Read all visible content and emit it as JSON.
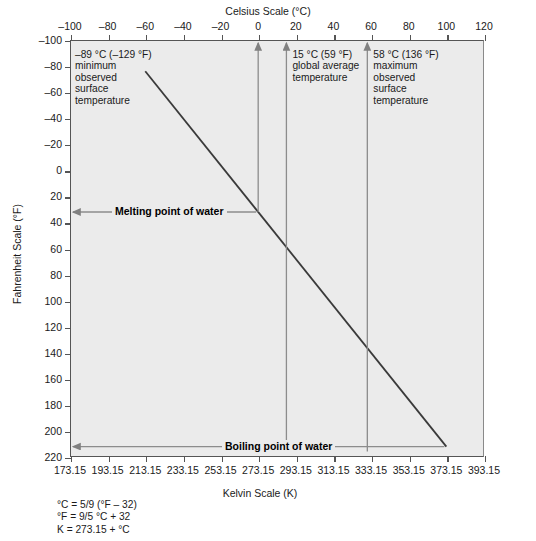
{
  "chart_data": {
    "type": "line",
    "title": "Celsius Scale (°C)",
    "xlabel_top": "Celsius Scale (°C)",
    "xlabel_bottom": "Kelvin Scale (K)",
    "ylabel": "Fahrenheit Scale (°F)",
    "grid": false,
    "legend": "none",
    "xlim_celsius": [
      -100,
      120
    ],
    "xlim_kelvin": [
      173.15,
      393.15
    ],
    "ylim_fahrenheit": [
      -100,
      220
    ],
    "y_axis_inverted": true,
    "x_ticks_celsius": [
      -100,
      -80,
      -60,
      -40,
      -20,
      0,
      20,
      40,
      60,
      80,
      100,
      120
    ],
    "x_ticklabels_celsius": [
      "–100",
      "–80",
      "–60",
      "–40",
      "–20",
      "0",
      "20",
      "40",
      "60",
      "80",
      "100",
      "120"
    ],
    "x_ticks_kelvin": [
      173.15,
      193.15,
      213.15,
      233.15,
      253.15,
      273.15,
      293.15,
      313.15,
      333.15,
      353.15,
      373.15,
      393.15
    ],
    "x_ticklabels_kelvin": [
      "173.15",
      "193.15",
      "213.15",
      "233.15",
      "253.15",
      "273.15",
      "293.15",
      "313.15",
      "333.15",
      "353.15",
      "373.15",
      "393.15"
    ],
    "y_ticks_fahrenheit": [
      -100,
      -80,
      -60,
      -40,
      -20,
      0,
      20,
      40,
      60,
      80,
      100,
      120,
      140,
      160,
      180,
      200,
      220
    ],
    "y_ticklabels_fahrenheit": [
      "–100",
      "–80",
      "–60",
      "–40",
      "–20",
      "0",
      "20",
      "40",
      "60",
      "80",
      "100",
      "120",
      "140",
      "160",
      "180",
      "200",
      "220"
    ],
    "series": [
      {
        "name": "Celsius to Fahrenheit conversion",
        "points": [
          {
            "celsius": -60,
            "fahrenheit": -76
          },
          {
            "celsius": 100,
            "fahrenheit": 212
          }
        ]
      }
    ],
    "markers": [
      {
        "name": "minimum-observed-surface-temperature",
        "celsius": 0,
        "label_celsius": "–89 °C",
        "label_fahrenheit": "–129 °F"
      },
      {
        "name": "global-average-temperature",
        "celsius": 15,
        "label_celsius": "15 °C",
        "label_fahrenheit": "59 °F"
      },
      {
        "name": "maximum-observed-surface-temperature",
        "celsius": 58,
        "label_celsius": "58 °C",
        "label_fahrenheit": "136 °F"
      }
    ],
    "annotations": [
      {
        "id": "min-temp",
        "text": "–89 °C (–129 °F)\nminimum\nobserved\nsurface\ntemperature"
      },
      {
        "id": "avg-temp",
        "text": "15 °C (59 °F)\nglobal average\ntemperature"
      },
      {
        "id": "max-temp",
        "text": "58 °C (136 °F)\nmaximum\nobserved\nsurface\ntemperature"
      },
      {
        "id": "melting-point",
        "text": "Melting point of water",
        "celsius": 0,
        "fahrenheit": 32
      },
      {
        "id": "boiling-point",
        "text": "Boiling point of water",
        "celsius": 100,
        "fahrenheit": 212
      }
    ],
    "formulas": "°C = 5/9 (°F – 32)\n°F = 9/5 °C + 32\nK = 273.15 + °C",
    "colors": {
      "plot_background": "#ebebeb",
      "axis": "#555555",
      "line": "#3a3a3a",
      "text": "#1a1a1a",
      "arrow": "#777777"
    }
  },
  "axes": {
    "celsius_title": "Celsius Scale (°C)",
    "kelvin_title": "Kelvin Scale (K)",
    "fahrenheit_title": "Fahrenheit Scale (°F)"
  },
  "labels": {
    "melting_point": "Melting point of water",
    "boiling_point": "Boiling point of water",
    "min_temp": "–89 °C (–129 °F)\nminimum\nobserved\nsurface\ntemperature",
    "avg_temp": "15 °C (59 °F)\nglobal average\ntemperature",
    "max_temp": "58 °C (136 °F)\nmaximum\nobserved\nsurface\ntemperature",
    "formulas": "°C = 5/9 (°F – 32)\n°F = 9/5 °C + 32\nK = 273.15 + °C"
  }
}
